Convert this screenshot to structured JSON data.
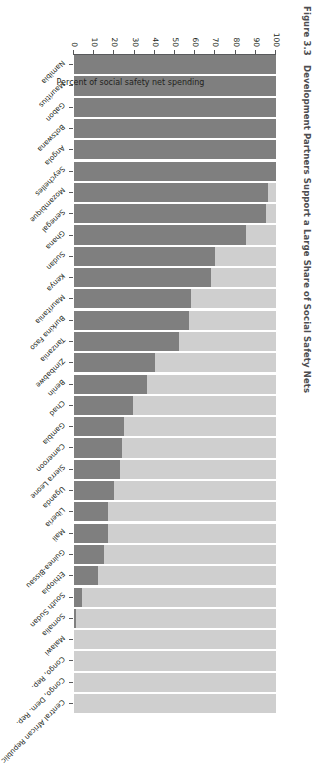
{
  "figure": {
    "number": "Figure 3.3",
    "title": "Development Partners Support a Large Share of Social Safety Nets"
  },
  "colors": {
    "partner": "#7f7f7f",
    "government": "#cfcfcf",
    "axis": "#58595b",
    "text": "#231f20",
    "title": "#4d4d4f"
  },
  "chart_data": {
    "type": "bar",
    "subtype": "stacked-bar",
    "xlabel": "",
    "ylabel": "Percent of social safety net spending",
    "ylim": [
      0,
      100
    ],
    "yticks": [
      "100",
      "90",
      "80",
      "70",
      "60",
      "50",
      "40",
      "30",
      "20",
      "10",
      "0"
    ],
    "grid": false,
    "legend_position": "none",
    "categories": [
      "Namibia",
      "Mauritius",
      "Gabon",
      "Botswana",
      "Angola",
      "Seychelles",
      "Mozambique",
      "Senegal",
      "Ghana",
      "Sudan",
      "Kenya",
      "Mauritania",
      "Burkina Faso",
      "Tanzania",
      "Zimbabwe",
      "Benin",
      "Chad",
      "Gambia",
      "Cameroon",
      "Sierra Leone",
      "Uganda",
      "Liberia",
      "Mali",
      "Guinea-Bissau",
      "Ethiopia",
      "South Sudan",
      "Somalia",
      "Malawi",
      "Congo, Rep.",
      "Congo, Dem. Rep.",
      "Central African Republic"
    ],
    "series": [
      {
        "name": "Government",
        "color": "#7f7f7f",
        "values": [
          100,
          100,
          100,
          100,
          100,
          100,
          96,
          95,
          85,
          70,
          68,
          58,
          57,
          52,
          40,
          36,
          29,
          25,
          24,
          23,
          20,
          17,
          17,
          15,
          12,
          4,
          1,
          0,
          0,
          0,
          0
        ]
      },
      {
        "name": "Development partners",
        "color": "#cfcfcf",
        "values": [
          0,
          0,
          0,
          0,
          0,
          0,
          4,
          5,
          15,
          30,
          32,
          42,
          43,
          48,
          60,
          64,
          71,
          75,
          76,
          77,
          80,
          83,
          83,
          85,
          88,
          96,
          99,
          100,
          100,
          100,
          100
        ]
      }
    ]
  }
}
